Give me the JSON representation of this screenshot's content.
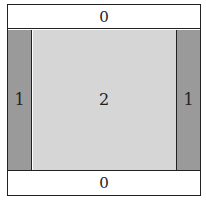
{
  "diagram": {
    "regions": {
      "top": {
        "label": "0",
        "fill": "#ffffff"
      },
      "left": {
        "label": "1",
        "fill": "#9a9a9a"
      },
      "center": {
        "label": "2",
        "fill": "#d6d6d6"
      },
      "right": {
        "label": "1",
        "fill": "#9a9a9a"
      },
      "bottom": {
        "label": "0",
        "fill": "#ffffff"
      }
    },
    "border_color": "#222222"
  }
}
